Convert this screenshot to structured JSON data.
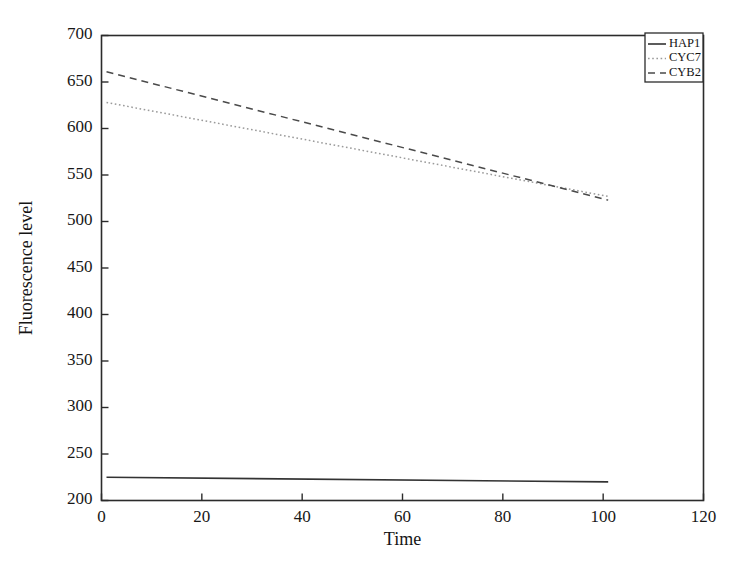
{
  "chart_data": {
    "type": "line",
    "title": "",
    "xlabel": "Time",
    "ylabel": "Fluorescence level",
    "xlim": [
      0,
      120
    ],
    "ylim": [
      200,
      700
    ],
    "xticks": [
      0,
      20,
      40,
      60,
      80,
      100,
      120
    ],
    "yticks": [
      200,
      250,
      300,
      350,
      400,
      450,
      500,
      550,
      600,
      650,
      700
    ],
    "xtick_labels": [
      "0",
      "20",
      "40",
      "60",
      "80",
      "100",
      "120"
    ],
    "ytick_labels": [
      "200",
      "250",
      "300",
      "350",
      "400",
      "450",
      "500",
      "550",
      "600",
      "650",
      "700"
    ],
    "grid": false,
    "legend_position": "top-right",
    "series": [
      {
        "name": "HAP1",
        "style": "solid",
        "color": "#333333",
        "x": [
          1,
          101
        ],
        "values": [
          225,
          220
        ]
      },
      {
        "name": "CYC7",
        "style": "dotted",
        "color": "#9a9a9a",
        "x": [
          1,
          101
        ],
        "values": [
          628,
          527
        ]
      },
      {
        "name": "CYB2",
        "style": "dashed",
        "color": "#4a4a4a",
        "x": [
          1,
          101
        ],
        "values": [
          661,
          523
        ]
      }
    ]
  },
  "legend": {
    "entries": [
      {
        "label": "HAP1"
      },
      {
        "label": "CYC7"
      },
      {
        "label": "CYB2"
      }
    ]
  },
  "axes": {
    "x_title": "Time",
    "y_title": "Fluorescence level"
  }
}
